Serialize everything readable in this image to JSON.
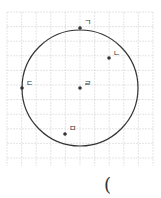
{
  "diagram": {
    "grid": {
      "x0": 7,
      "y0": 12,
      "x1": 153,
      "y1": 166,
      "step": 14.6,
      "color": "#d9d9d9"
    },
    "circle": {
      "cx": 80,
      "cy": 88,
      "r": 58,
      "color": "#333333"
    },
    "points": [
      {
        "label": "ㄱ",
        "x": 80,
        "y": 28,
        "lx": 84,
        "ly": 25
      },
      {
        "label": "ㄴ",
        "x": 109,
        "y": 58,
        "lx": 113,
        "ly": 56
      },
      {
        "label": "ㄷ",
        "x": 22,
        "y": 88,
        "lx": 26,
        "ly": 86
      },
      {
        "label": "ㄹ",
        "x": 80,
        "y": 88,
        "lx": 84,
        "ly": 86
      },
      {
        "label": "ㅁ",
        "x": 65,
        "y": 134,
        "lx": 69,
        "ly": 131
      }
    ]
  },
  "answer": {
    "paren": "("
  }
}
